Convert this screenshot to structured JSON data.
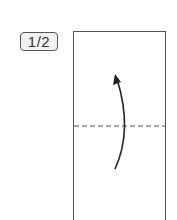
{
  "step": {
    "label": "1/2"
  },
  "diagram": {
    "paper": {
      "shape": "rectangle",
      "stroke": "#555555"
    },
    "fold_line": {
      "style": "dashed",
      "description": "valley fold line at middle",
      "color": "#555555"
    },
    "arrow": {
      "icon": "curved-fold-arrow-up",
      "color": "#222222",
      "direction": "up"
    }
  }
}
